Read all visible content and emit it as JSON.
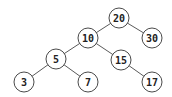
{
  "diagram": {
    "type": "binary-search-tree",
    "colors": {
      "edge": "#5a5a5a",
      "node_stroke": "#4a4a4a",
      "node_fill": "#ffffff",
      "label": "#222222"
    },
    "nodes": [
      {
        "id": "n20",
        "label": "20",
        "x": 119,
        "y": 18
      },
      {
        "id": "n10",
        "label": "10",
        "x": 88,
        "y": 38
      },
      {
        "id": "n30",
        "label": "30",
        "x": 152,
        "y": 38
      },
      {
        "id": "n5",
        "label": "5",
        "x": 56,
        "y": 59
      },
      {
        "id": "n15",
        "label": "15",
        "x": 121,
        "y": 60
      },
      {
        "id": "n3",
        "label": "3",
        "x": 24,
        "y": 82
      },
      {
        "id": "n7",
        "label": "7",
        "x": 88,
        "y": 82
      },
      {
        "id": "n17",
        "label": "17",
        "x": 152,
        "y": 82
      }
    ],
    "edges": [
      {
        "from": "n20",
        "to": "n10"
      },
      {
        "from": "n20",
        "to": "n30"
      },
      {
        "from": "n10",
        "to": "n5"
      },
      {
        "from": "n10",
        "to": "n15"
      },
      {
        "from": "n5",
        "to": "n3"
      },
      {
        "from": "n5",
        "to": "n7"
      },
      {
        "from": "n15",
        "to": "n17"
      }
    ],
    "node_radius": 10
  }
}
